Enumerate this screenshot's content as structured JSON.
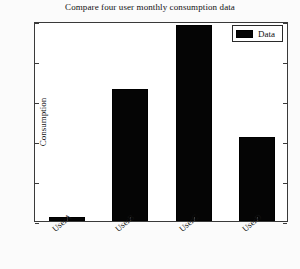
{
  "chart_data": {
    "type": "bar",
    "title": "Compare four user monthly consumption data",
    "xlabel": "",
    "ylabel": "Consumption",
    "categories": [
      "UserA",
      "UserB",
      "UserC",
      "UserD"
    ],
    "values": [
      2,
      66,
      98,
      42
    ],
    "series": [
      {
        "name": "Data",
        "values": [
          2,
          66,
          98,
          42
        ]
      }
    ],
    "ylim": [
      0,
      100
    ],
    "yticks": [
      0,
      20,
      40,
      60,
      80,
      100
    ],
    "ytick_labels": [
      "0",
      "20",
      "40",
      "60",
      "80",
      "100"
    ],
    "grid": false,
    "legend": {
      "position": "upper-right",
      "entries": [
        "Data"
      ]
    },
    "colors": {
      "bar": "#050505",
      "axis": "#3a3a3a",
      "text": "#111111",
      "background": "#ffffff"
    }
  }
}
